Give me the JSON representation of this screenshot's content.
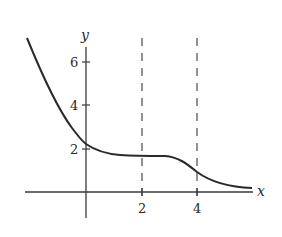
{
  "figure": {
    "type": "function-graph",
    "x_axis_label": "x",
    "y_axis_label": "y",
    "x_ticks": [
      {
        "value": 2,
        "label": "2"
      },
      {
        "value": 4,
        "label": "4"
      }
    ],
    "y_ticks": [
      {
        "value": 2,
        "label": "2"
      },
      {
        "value": 4,
        "label": "4"
      },
      {
        "value": 6,
        "label": "6"
      }
    ],
    "dashed_vertical_lines_at_x": [
      2,
      4
    ],
    "curve_description": "Decreasing curve: steep descent from upper-left, crosses y-axis near y=2.2, levels off to a plateau near y=1.7 between x=1 and x=3, drops again around x=4 (inflection), then decays toward the x-axis",
    "curve_points": [
      {
        "x": -2.15,
        "y": 7.0
      },
      {
        "x": -1.5,
        "y": 5.1
      },
      {
        "x": -1.0,
        "y": 3.8
      },
      {
        "x": -0.4,
        "y": 2.7
      },
      {
        "x": 0.0,
        "y": 2.2
      },
      {
        "x": 0.7,
        "y": 1.85
      },
      {
        "x": 1.25,
        "y": 1.72
      },
      {
        "x": 2.0,
        "y": 1.7
      },
      {
        "x": 2.9,
        "y": 1.65
      },
      {
        "x": 3.6,
        "y": 1.2
      },
      {
        "x": 4.0,
        "y": 0.8
      },
      {
        "x": 4.65,
        "y": 0.45
      },
      {
        "x": 5.4,
        "y": 0.27
      },
      {
        "x": 6.0,
        "y": 0.2
      }
    ],
    "colors": {
      "curve": "#2a2a2a",
      "axes": "#3a3a3a",
      "dashed": "#4a4a4a",
      "background": "#ffffff"
    }
  }
}
